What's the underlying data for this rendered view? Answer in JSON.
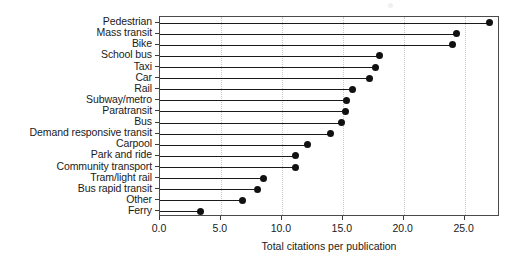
{
  "chart_data": {
    "type": "bar",
    "subtype": "lollipop-horizontal",
    "title": "",
    "xlabel": "Total citations per publication",
    "ylabel": "",
    "xlim": [
      0.0,
      27.9
    ],
    "xticks": [
      "0.0",
      "5.0",
      "10.0",
      "15.0",
      "20.0",
      "25.0"
    ],
    "xtickvalues": [
      0,
      5,
      10,
      15,
      20,
      25
    ],
    "grid": "vertical-dotted",
    "legend": "none",
    "categories": [
      "Pedestrian",
      "Mass transit",
      "Bike",
      "School bus",
      "Taxi",
      "Car",
      "Rail",
      "Subway/metro",
      "Paratransit",
      "Bus",
      "Demand responsive transit",
      "Carpool",
      "Park and ride",
      "Community transport",
      "Tram/light rail",
      "Bus rapid transit",
      "Other",
      "Ferry"
    ],
    "values": [
      27.0,
      24.3,
      24.0,
      18.0,
      17.7,
      17.2,
      15.8,
      15.3,
      15.2,
      14.9,
      14.0,
      12.1,
      11.1,
      11.1,
      8.5,
      8.0,
      6.8,
      3.3
    ],
    "marker_color": "#111111",
    "line_color": "#1a1a1a",
    "grid_color": "#c8c8c8",
    "axis_color": "#4a4a4a"
  }
}
